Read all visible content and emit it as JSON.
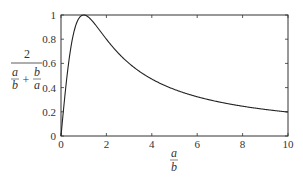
{
  "chart_data": {
    "type": "line",
    "title": "",
    "xlabel": "a/b",
    "ylabel": "2 / (a/b + b/a)",
    "xlim": [
      0,
      10
    ],
    "ylim": [
      0,
      1
    ],
    "xticks": [
      "0",
      "2",
      "4",
      "6",
      "8",
      "10"
    ],
    "yticks": [
      "0",
      "0.2",
      "0.4",
      "0.6",
      "0.8",
      "1"
    ],
    "grid": false,
    "legend": null,
    "series": [
      {
        "name": "2/(a/b + b/a)",
        "x": [
          0,
          0.25,
          0.5,
          0.75,
          1,
          1.5,
          2,
          3,
          4,
          5,
          6,
          7,
          8,
          9,
          10
        ],
        "values": [
          0,
          0.47,
          0.8,
          0.96,
          1.0,
          0.92,
          0.8,
          0.6,
          0.47,
          0.38,
          0.32,
          0.28,
          0.25,
          0.22,
          0.2
        ]
      }
    ]
  },
  "labels": {
    "y_num": "2",
    "y_a1": "a",
    "y_b1": "b",
    "y_plus": "+",
    "y_b2": "b",
    "y_a2": "a",
    "x_num": "a",
    "x_den": "b"
  }
}
